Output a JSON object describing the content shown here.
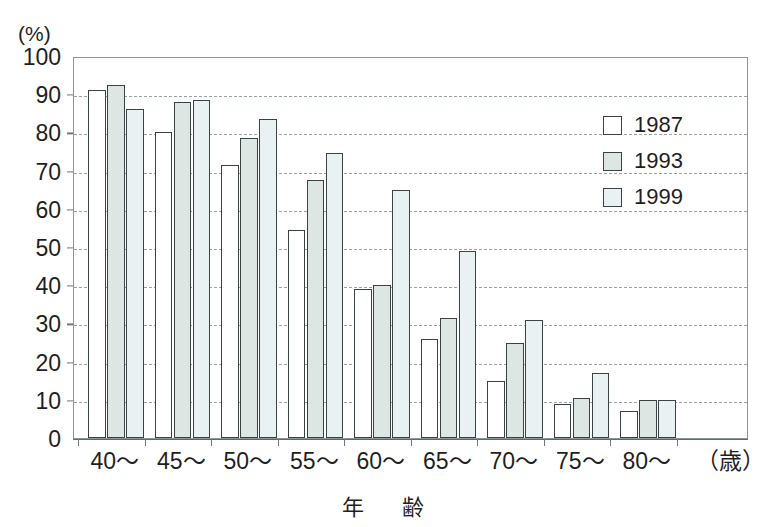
{
  "chart_data": {
    "type": "bar",
    "title": "",
    "subtitle": "",
    "xlabel": "年　齢",
    "ylabel": "(%)",
    "x_unit_label": "（歳）",
    "categories": [
      "40〜",
      "45〜",
      "50〜",
      "55〜",
      "60〜",
      "65〜",
      "70〜",
      "75〜",
      "80〜"
    ],
    "series": [
      {
        "name": "1987",
        "color": "#ffffff",
        "values": [
          91,
          80,
          71.5,
          54.5,
          39,
          26,
          15,
          9,
          7
        ]
      },
      {
        "name": "1993",
        "color": "#dde6e2",
        "values": [
          92.5,
          88,
          78.5,
          67.5,
          40,
          31.5,
          25,
          10.5,
          10
        ]
      },
      {
        "name": "1999",
        "color": "#eaf1f3",
        "values": [
          86,
          88.5,
          83.5,
          74.5,
          65,
          49,
          31,
          17,
          10
        ]
      }
    ],
    "ylim": [
      0,
      100
    ],
    "y_ticks": [
      0,
      10,
      20,
      30,
      40,
      50,
      60,
      70,
      80,
      90,
      100
    ],
    "y_tick_labels": [
      "0",
      "10",
      "20",
      "30",
      "40",
      "50",
      "60",
      "70",
      "80",
      "90",
      "100"
    ],
    "grid": true,
    "grid_axis": "y",
    "grid_style": "dashed",
    "legend_position": "top-right",
    "bar_outline_color": "#3a4244",
    "frame_color": "#8d9699",
    "gridline_color": "#9aa3a6"
  },
  "legend": {
    "entries": [
      {
        "label": "1987"
      },
      {
        "label": "1993"
      },
      {
        "label": "1999"
      }
    ]
  }
}
